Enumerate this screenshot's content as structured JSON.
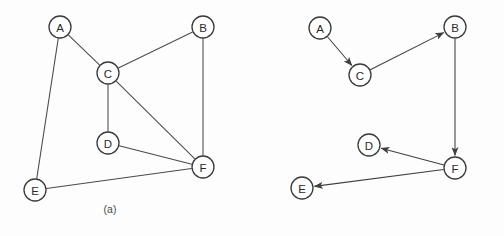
{
  "figure": {
    "type": "graph-diagram-pair",
    "background_color": "#fdfdfd",
    "node_stroke_color": "#3a3a3a",
    "node_fill_color": "#ffffff",
    "edge_color": "#4a4a4a",
    "label_color": "#2a2a2a",
    "node_radius": 11
  },
  "panel_a": {
    "caption": "(a)",
    "graph_kind": "undirected",
    "nodes": [
      {
        "id": "A",
        "label": "A",
        "x": 60,
        "y": 27
      },
      {
        "id": "B",
        "label": "B",
        "x": 203,
        "y": 27
      },
      {
        "id": "C",
        "label": "C",
        "x": 108,
        "y": 73
      },
      {
        "id": "D",
        "label": "D",
        "x": 108,
        "y": 143
      },
      {
        "id": "E",
        "label": "E",
        "x": 35,
        "y": 190
      },
      {
        "id": "F",
        "label": "F",
        "x": 203,
        "y": 167
      }
    ],
    "edges": [
      {
        "from": "A",
        "to": "C"
      },
      {
        "from": "A",
        "to": "E"
      },
      {
        "from": "C",
        "to": "B"
      },
      {
        "from": "C",
        "to": "D"
      },
      {
        "from": "C",
        "to": "F"
      },
      {
        "from": "B",
        "to": "F"
      },
      {
        "from": "D",
        "to": "F"
      },
      {
        "from": "E",
        "to": "F"
      }
    ]
  },
  "panel_b": {
    "caption": "(b)",
    "graph_kind": "directed",
    "nodes": [
      {
        "id": "A",
        "label": "A",
        "x": 68,
        "y": 28
      },
      {
        "id": "B",
        "label": "B",
        "x": 203,
        "y": 27
      },
      {
        "id": "C",
        "label": "C",
        "x": 108,
        "y": 75
      },
      {
        "id": "D",
        "label": "D",
        "x": 117,
        "y": 145
      },
      {
        "id": "E",
        "label": "E",
        "x": 50,
        "y": 188
      },
      {
        "id": "F",
        "label": "F",
        "x": 203,
        "y": 168
      }
    ],
    "edges": [
      {
        "from": "A",
        "to": "C",
        "directed": true
      },
      {
        "from": "C",
        "to": "B",
        "directed": true
      },
      {
        "from": "B",
        "to": "F",
        "directed": true
      },
      {
        "from": "F",
        "to": "D",
        "directed": true
      },
      {
        "from": "F",
        "to": "E",
        "directed": true
      }
    ]
  }
}
